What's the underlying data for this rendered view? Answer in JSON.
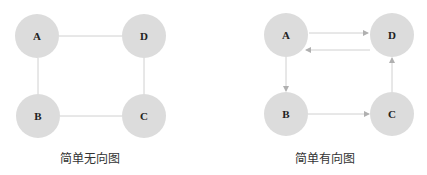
{
  "diagrams": [
    {
      "caption": "简单无向图",
      "directed": false,
      "nodes": [
        {
          "id": "A",
          "label": "A"
        },
        {
          "id": "D",
          "label": "D"
        },
        {
          "id": "B",
          "label": "B"
        },
        {
          "id": "C",
          "label": "C"
        }
      ],
      "edges": [
        [
          "A",
          "D"
        ],
        [
          "A",
          "B"
        ],
        [
          "B",
          "C"
        ],
        [
          "D",
          "C"
        ]
      ]
    },
    {
      "caption": "简单有向图",
      "directed": true,
      "nodes": [
        {
          "id": "A",
          "label": "A"
        },
        {
          "id": "D",
          "label": "D"
        },
        {
          "id": "B",
          "label": "B"
        },
        {
          "id": "C",
          "label": "C"
        }
      ],
      "edges": [
        [
          "A",
          "D"
        ],
        [
          "D",
          "A"
        ],
        [
          "A",
          "B"
        ],
        [
          "B",
          "C"
        ],
        [
          "C",
          "D"
        ]
      ]
    }
  ],
  "colors": {
    "node": "#dcdcdc",
    "edge": "#d0d0d0",
    "text": "#222222"
  }
}
